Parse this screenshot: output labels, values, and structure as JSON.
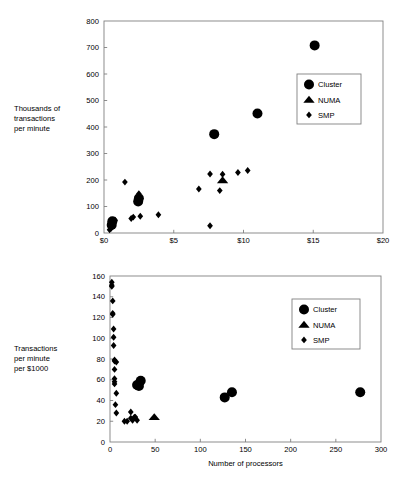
{
  "figure": {
    "background": "#ffffff",
    "ink": "#000000",
    "axis_color": "#808080"
  },
  "chart_data": [
    {
      "id": "top",
      "type": "scatter",
      "title": "",
      "xlabel": "Total system cost (millions)",
      "ylabel": "Thousands of\ntransactions\nper minute",
      "xlim": [
        0,
        20
      ],
      "ylim": [
        0,
        800
      ],
      "xticks": [
        0,
        5,
        10,
        15,
        20
      ],
      "xticklabels": [
        "$0",
        "$5",
        "$10",
        "$15",
        "$20"
      ],
      "yticks": [
        0,
        100,
        200,
        300,
        400,
        500,
        600,
        700,
        800
      ],
      "yticklabels": [
        "0",
        "100",
        "200",
        "300",
        "400",
        "500",
        "600",
        "700",
        "800"
      ],
      "grid": false,
      "legend_position": "upper right",
      "series": [
        {
          "name": "Cluster",
          "marker": "circle",
          "color": "#000000",
          "points": [
            [
              15.1,
              708
            ],
            [
              11.0,
              451
            ],
            [
              7.9,
              373
            ],
            [
              2.5,
              131
            ],
            [
              2.45,
              119
            ],
            [
              0.55,
              30
            ],
            [
              0.6,
              44
            ]
          ]
        },
        {
          "name": "NUMA",
          "marker": "triangle",
          "color": "#000000",
          "points": [
            [
              8.5,
              199
            ]
          ]
        },
        {
          "name": "SMP",
          "marker": "diamond",
          "color": "#000000",
          "points": [
            [
              10.3,
              236
            ],
            [
              9.6,
              228
            ],
            [
              8.5,
              222
            ],
            [
              7.6,
              223
            ],
            [
              8.3,
              160
            ],
            [
              6.8,
              166
            ],
            [
              7.6,
              27
            ],
            [
              3.9,
              69
            ],
            [
              2.6,
              63
            ],
            [
              2.1,
              60
            ],
            [
              1.95,
              55
            ],
            [
              1.5,
              192
            ],
            [
              2.5,
              148
            ],
            [
              0.8,
              48
            ],
            [
              0.7,
              41
            ],
            [
              0.6,
              24
            ],
            [
              0.5,
              17
            ],
            [
              0.4,
              12
            ],
            [
              0.45,
              33
            ]
          ]
        }
      ]
    },
    {
      "id": "bottom",
      "type": "scatter",
      "title": "",
      "xlabel": "Number of processors",
      "ylabel": "Transactions\nper minute\nper $1000",
      "xlim": [
        0,
        300
      ],
      "ylim": [
        0,
        160
      ],
      "xticks": [
        0,
        50,
        100,
        150,
        200,
        250,
        300
      ],
      "xticklabels": [
        "0",
        "50",
        "100",
        "150",
        "200",
        "250",
        "300"
      ],
      "yticks": [
        0,
        20,
        40,
        60,
        80,
        100,
        120,
        140,
        160
      ],
      "yticklabels": [
        "0",
        "20",
        "40",
        "60",
        "80",
        "100",
        "120",
        "140",
        "160"
      ],
      "grid": false,
      "legend_position": "upper right",
      "series": [
        {
          "name": "Cluster",
          "marker": "circle",
          "color": "#000000",
          "points": [
            [
              277,
              48
            ],
            [
              135,
              48
            ],
            [
              127,
              43
            ],
            [
              34,
              59
            ],
            [
              32,
              54
            ],
            [
              30,
              55
            ]
          ]
        },
        {
          "name": "NUMA",
          "marker": "triangle",
          "color": "#000000",
          "points": [
            [
              49,
              24
            ]
          ]
        },
        {
          "name": "SMP",
          "marker": "diamond",
          "color": "#000000",
          "points": [
            [
              2,
              154
            ],
            [
              2,
              151
            ],
            [
              2,
              150
            ],
            [
              3,
              136
            ],
            [
              3,
              124
            ],
            [
              3,
              123
            ],
            [
              4,
              109
            ],
            [
              4,
              101
            ],
            [
              4,
              93
            ],
            [
              5,
              79
            ],
            [
              5,
              78
            ],
            [
              7,
              77
            ],
            [
              5,
              70
            ],
            [
              5,
              61
            ],
            [
              5,
              58
            ],
            [
              5,
              56
            ],
            [
              7,
              47
            ],
            [
              6,
              36
            ],
            [
              7,
              28
            ],
            [
              16,
              20
            ],
            [
              19,
              20
            ],
            [
              23,
              29
            ],
            [
              23,
              23
            ],
            [
              25,
              21
            ],
            [
              27,
              24
            ],
            [
              28,
              24
            ],
            [
              30,
              21
            ]
          ]
        }
      ]
    }
  ],
  "legend": {
    "entries": [
      {
        "label": "Cluster",
        "marker": "circle"
      },
      {
        "label": "NUMA",
        "marker": "triangle"
      },
      {
        "label": "SMP",
        "marker": "diamond"
      }
    ]
  }
}
